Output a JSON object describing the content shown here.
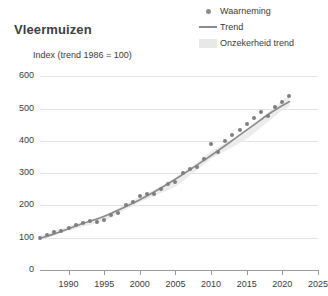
{
  "title": "Vleermuizen",
  "axis_title": "Index (trend 1986 = 100)",
  "legend": {
    "position": "top-right",
    "items": [
      {
        "label": "Waarneming",
        "marker": "dot-marker-icon",
        "color": "#8c8c8c"
      },
      {
        "label": "Trend",
        "marker": "line-marker-icon",
        "color": "#8c8c8c"
      },
      {
        "label": "Onzekerheid trend",
        "marker": "band-marker-icon",
        "color": "#e8e8e8"
      }
    ]
  },
  "colors": {
    "point": "#7f7f7f",
    "trend": "#8a8a8a",
    "band": "#ececec",
    "grid": "#e4e4e4",
    "axis": "#9a9a9a",
    "text": "#3b3b3b",
    "background": "#ffffff"
  },
  "chart_data": {
    "type": "line",
    "title": "Vleermuizen",
    "subtitle": "",
    "xlabel": "",
    "ylabel": "Index (trend 1986 = 100)",
    "xlim": [
      1986,
      2025
    ],
    "ylim": [
      0,
      620
    ],
    "xticks": [
      1990,
      1995,
      2000,
      2005,
      2010,
      2015,
      2020,
      2025
    ],
    "yticks": [
      0,
      100,
      200,
      300,
      400,
      500,
      600
    ],
    "grid": true,
    "legend_position": "top-right",
    "series": [
      {
        "name": "Waarneming",
        "type": "scatter",
        "x": [
          1986,
          1987,
          1988,
          1989,
          1990,
          1991,
          1992,
          1993,
          1994,
          1995,
          1996,
          1997,
          1998,
          1999,
          2000,
          2001,
          2002,
          2003,
          2004,
          2005,
          2006,
          2007,
          2008,
          2009,
          2010,
          2011,
          2012,
          2013,
          2014,
          2015,
          2016,
          2017,
          2018,
          2019,
          2020,
          2021
        ],
        "values": [
          100,
          108,
          118,
          122,
          130,
          140,
          146,
          152,
          150,
          155,
          172,
          178,
          200,
          212,
          228,
          235,
          236,
          250,
          268,
          272,
          300,
          312,
          318,
          345,
          390,
          366,
          400,
          420,
          435,
          452,
          470,
          490,
          478,
          505,
          520,
          540
        ]
      },
      {
        "name": "Trend",
        "type": "line",
        "x": [
          1986,
          1988,
          1990,
          1992,
          1994,
          1996,
          1998,
          2000,
          2002,
          2004,
          2006,
          2008,
          2010,
          2012,
          2014,
          2016,
          2018,
          2020,
          2021
        ],
        "values": [
          98,
          112,
          128,
          144,
          158,
          176,
          196,
          218,
          242,
          268,
          296,
          325,
          355,
          386,
          418,
          450,
          482,
          510,
          522
        ]
      },
      {
        "name": "Onzekerheid trend",
        "type": "band",
        "x": [
          1986,
          1990,
          1995,
          2000,
          2005,
          2010,
          2015,
          2020,
          2021
        ],
        "lower": [
          92,
          122,
          152,
          210,
          258,
          344,
          406,
          496,
          506
        ],
        "upper": [
          106,
          136,
          168,
          228,
          280,
          368,
          432,
          526,
          540
        ]
      }
    ]
  }
}
